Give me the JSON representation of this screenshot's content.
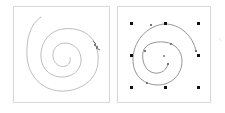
{
  "canvas": {
    "width": 225,
    "height": 113,
    "background": "#ffffff"
  },
  "panels": [
    {
      "id": "freehand",
      "label": "",
      "frame_color": "#d8d8d8",
      "stroke_color": "#b0b0b0",
      "cursor_icon": "pencil-scribble-icon"
    },
    {
      "id": "vector-path",
      "label": "",
      "frame_color": "#d8d8d8",
      "stroke_color": "#888888",
      "handle_color": "#111111",
      "anchor_color": "#777777",
      "handle_positions": [
        [
          131,
          23
        ],
        [
          165,
          23
        ],
        [
          198,
          23
        ],
        [
          131,
          55
        ],
        [
          198,
          55
        ],
        [
          131,
          87
        ],
        [
          165,
          87
        ],
        [
          198,
          87
        ]
      ],
      "center_point": [
        164,
        56
      ]
    }
  ]
}
